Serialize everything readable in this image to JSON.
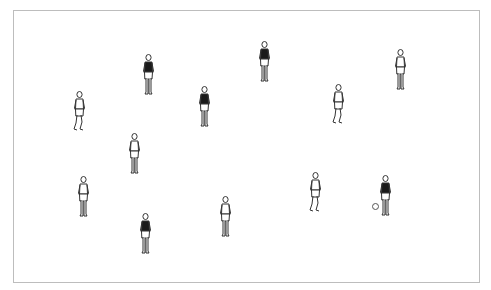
{
  "caption": {
    "text": ""
  },
  "field": {
    "border_color": "#bdbdbd",
    "background": "#ffffff"
  },
  "players": [
    {
      "id": 1,
      "x": 140,
      "y": 54,
      "shirt": "dark",
      "pose": "standing"
    },
    {
      "id": 2,
      "x": 256,
      "y": 41,
      "shirt": "dark",
      "pose": "standing"
    },
    {
      "id": 3,
      "x": 392,
      "y": 49,
      "shirt": "light",
      "pose": "standing"
    },
    {
      "id": 4,
      "x": 71,
      "y": 91,
      "shirt": "light",
      "pose": "walking"
    },
    {
      "id": 5,
      "x": 196,
      "y": 86,
      "shirt": "dark",
      "pose": "standing"
    },
    {
      "id": 6,
      "x": 330,
      "y": 84,
      "shirt": "light",
      "pose": "walking"
    },
    {
      "id": 7,
      "x": 126,
      "y": 133,
      "shirt": "light",
      "pose": "standing"
    },
    {
      "id": 8,
      "x": 75,
      "y": 176,
      "shirt": "light",
      "pose": "standing"
    },
    {
      "id": 9,
      "x": 137,
      "y": 213,
      "shirt": "dark",
      "pose": "standing"
    },
    {
      "id": 10,
      "x": 217,
      "y": 196,
      "shirt": "light",
      "pose": "standing"
    },
    {
      "id": 11,
      "x": 307,
      "y": 172,
      "shirt": "light",
      "pose": "walking"
    },
    {
      "id": 12,
      "x": 377,
      "y": 175,
      "shirt": "dark",
      "pose": "standing"
    }
  ],
  "ball": {
    "x": 372,
    "y": 203
  },
  "colors": {
    "dark_shirt": "#1a1a1a",
    "light_shirt": "#ffffff",
    "outline": "#333333"
  }
}
